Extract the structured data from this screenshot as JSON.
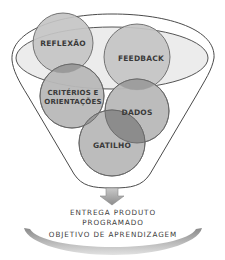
{
  "diagram": {
    "type": "funnel",
    "colors": {
      "outline": "#4a4a4a",
      "inner_ellipse_fill": "#ececec",
      "circle_fill": "#bdbdbd",
      "circle_stroke": "#666666",
      "overlap_fill": "#8f8f8f",
      "text": "#3a3a3a",
      "band_dark": "#8a8a8a",
      "band_light": "#d8d8d8"
    },
    "funnel_inputs": [
      {
        "id": "reflexao",
        "label": "REFLEXÃO"
      },
      {
        "id": "feedback",
        "label": "FEEDBACK"
      },
      {
        "id": "criterios",
        "label_line1": "CRITÉRIOS E",
        "label_line2": "ORIENTAÇÕES"
      },
      {
        "id": "dados",
        "label": "DADOS"
      },
      {
        "id": "gatilho",
        "label": "GATILHO"
      }
    ],
    "arrow_icon": "down-arrow-icon",
    "output": {
      "line1": "ENTREGA PRODUTO",
      "line2": "PROGRAMADO",
      "line3": "OBJETIVO DE APRENDIZAGEM"
    }
  }
}
